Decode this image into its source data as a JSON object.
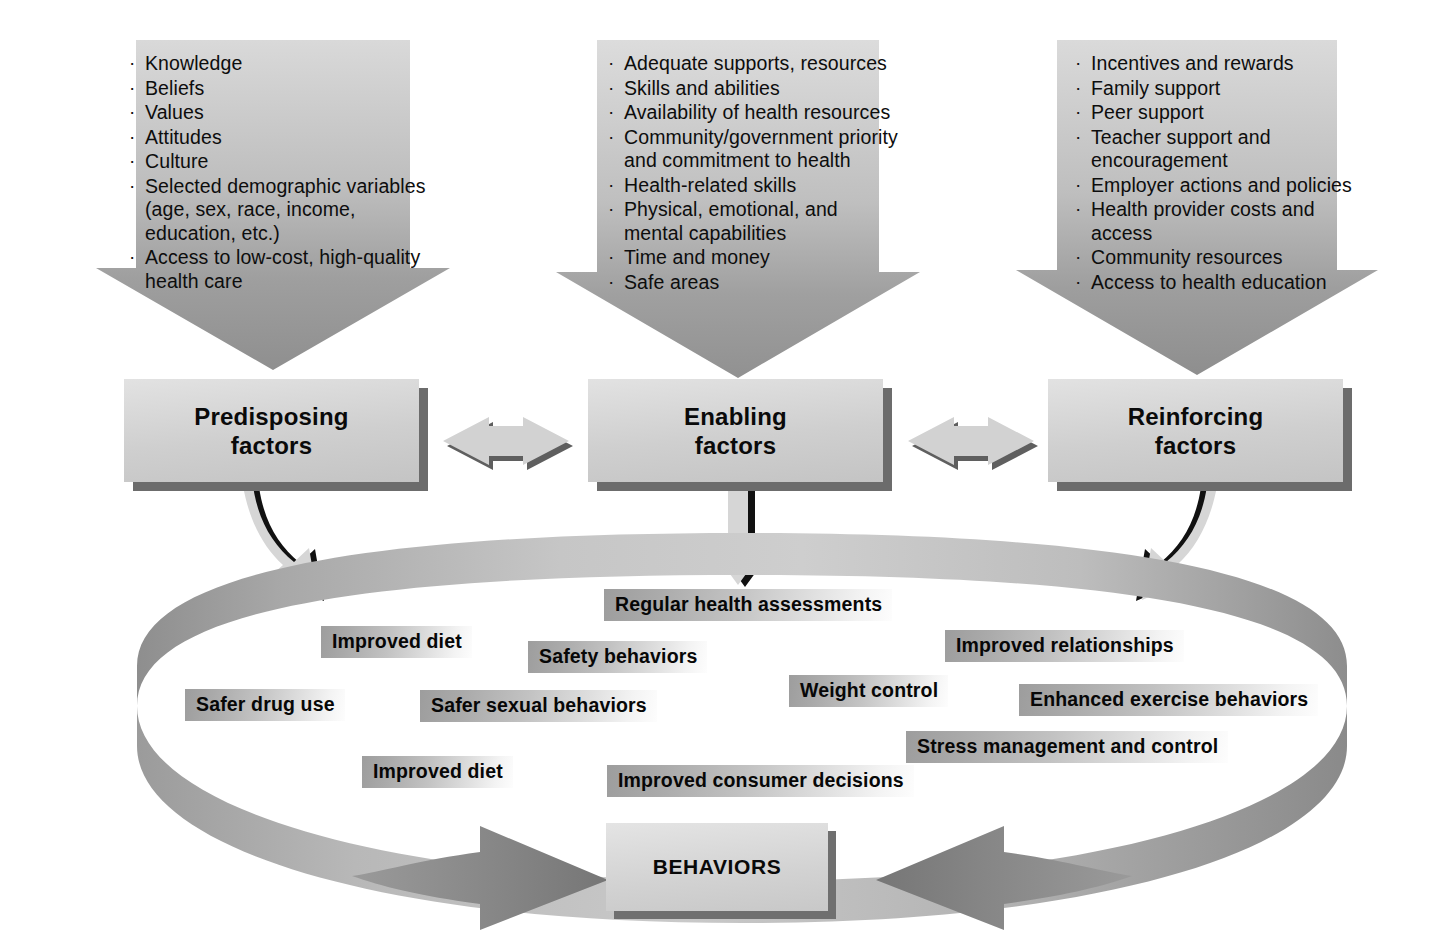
{
  "diagram": {
    "accent_dark": "#6c6c6c",
    "accent_mid": "#9b9b9b",
    "accent_light": "#d8d8d8"
  },
  "inputs": [
    {
      "id": "predisposing-input",
      "items": [
        "Knowledge",
        "Beliefs",
        "Values",
        "Attitudes",
        "Culture",
        "Selected demographic variables (age, sex, race, income, education, etc.)",
        "Access to low-cost, high-quality health care"
      ]
    },
    {
      "id": "enabling-input",
      "items": [
        "Adequate supports, resources",
        "Skills and abilities",
        "Availability of health resources",
        "Community/government priority and commitment to health",
        "Health-related skills",
        "Physical, emotional, and mental capabilities",
        "Time and money",
        "Safe areas"
      ]
    },
    {
      "id": "reinforcing-input",
      "items": [
        "Incentives and rewards",
        "Family support",
        "Peer support",
        "Teacher support and encouragement",
        "Employer actions and policies",
        "Health provider costs and access",
        "Community resources",
        "Access to health education"
      ]
    }
  ],
  "factors": [
    {
      "id": "predisposing",
      "line1": "Predisposing",
      "line2": "factors"
    },
    {
      "id": "enabling",
      "line1": "Enabling",
      "line2": "factors"
    },
    {
      "id": "reinforcing",
      "line1": "Reinforcing",
      "line2": "factors"
    }
  ],
  "behaviors_box": {
    "label": "BEHAVIORS"
  },
  "behavior_labels": [
    {
      "id": "regular-health-assessments",
      "text": "Regular health assessments"
    },
    {
      "id": "improved-diet-upper",
      "text": "Improved diet"
    },
    {
      "id": "safety-behaviors",
      "text": "Safety behaviors"
    },
    {
      "id": "improved-relationships",
      "text": "Improved relationships"
    },
    {
      "id": "safer-drug-use",
      "text": "Safer drug use"
    },
    {
      "id": "safer-sexual-behaviors",
      "text": "Safer sexual behaviors"
    },
    {
      "id": "weight-control",
      "text": "Weight control"
    },
    {
      "id": "enhanced-exercise-behaviors",
      "text": "Enhanced exercise behaviors"
    },
    {
      "id": "stress-management",
      "text": "Stress management and control"
    },
    {
      "id": "improved-diet-lower",
      "text": "Improved diet"
    },
    {
      "id": "improved-consumer-decisions",
      "text": "Improved consumer decisions"
    }
  ]
}
